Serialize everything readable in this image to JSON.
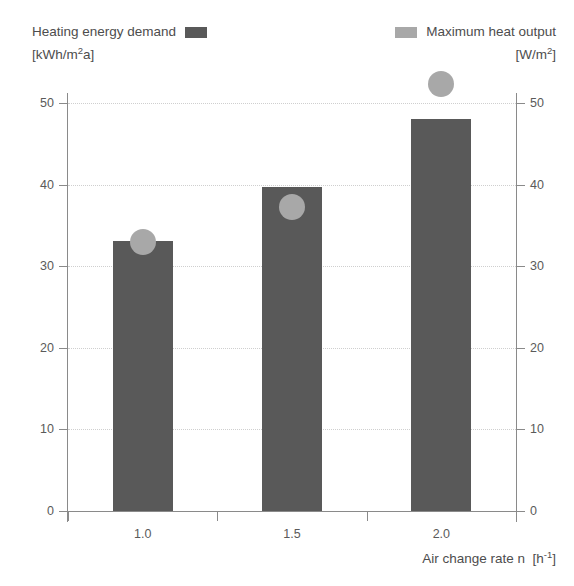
{
  "legend": {
    "left": {
      "label": "Heating energy demand",
      "unit_prefix": "[kWh/m",
      "unit_sup": "2",
      "unit_suffix": "a]",
      "swatch_name": "bar-swatch",
      "color": "#595959"
    },
    "right": {
      "label": "Maximum heat output",
      "unit_prefix": "[W/m",
      "unit_sup": "2",
      "unit_suffix": "]",
      "swatch_name": "dot-swatch",
      "color": "#a8a8a8"
    }
  },
  "axes": {
    "x_title_main": "Air change rate n",
    "x_title_unit_prefix": "[h",
    "x_title_unit_sup": "-1",
    "x_title_unit_suffix": "]",
    "y_ticks": [
      "0",
      "10",
      "20",
      "30",
      "40",
      "50"
    ],
    "x_ticks": [
      "1.0",
      "1.5",
      "2.0"
    ]
  },
  "chart_data": {
    "type": "bar",
    "title": "",
    "subtitle": "",
    "xlabel": "Air change rate n [h-1]",
    "ylabel": "",
    "ylabel_left": "Heating energy demand [kWh/m2a]",
    "ylabel_right": "Maximum heat output [W/m2]",
    "categories": [
      "1.0",
      "1.5",
      "2.0"
    ],
    "ylim": [
      0,
      50
    ],
    "y_ticks": [
      0,
      10,
      20,
      30,
      40,
      50
    ],
    "y_ticks_right": [
      0,
      10,
      20,
      30,
      40,
      50
    ],
    "grid": true,
    "grid_style": "dotted",
    "legend_position": "top",
    "series": [
      {
        "name": "Heating energy demand",
        "unit": "kWh/m2a",
        "type": "bar",
        "color": "#595959",
        "values": [
          33.1,
          39.7,
          48.0
        ]
      },
      {
        "name": "Maximum heat output",
        "unit": "W/m2",
        "type": "scatter",
        "color": "#a8a8a8",
        "marker": "circle",
        "values": [
          33.0,
          37.3,
          52.3
        ]
      }
    ]
  }
}
